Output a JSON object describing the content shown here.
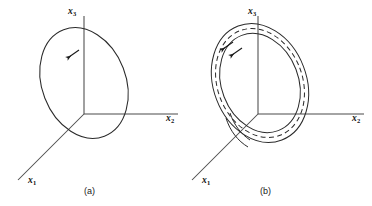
{
  "figure": {
    "background_color": "#ffffff",
    "stroke_color": "#1a1a1a",
    "panels": [
      {
        "id": "a",
        "caption": "(a)",
        "axes": [
          {
            "name": "x3",
            "label_base": "x",
            "label_sub": "3",
            "direction": "up"
          },
          {
            "name": "x2",
            "label_base": "x",
            "label_sub": "2",
            "direction": "right"
          },
          {
            "name": "x1",
            "label_base": "x",
            "label_sub": "1",
            "direction": "down-left"
          }
        ],
        "curves": [
          {
            "name": "closed-orbit",
            "style": "solid",
            "arrows": 1
          }
        ]
      },
      {
        "id": "b",
        "caption": "(b)",
        "axes": [
          {
            "name": "x3",
            "label_base": "x",
            "label_sub": "3",
            "direction": "up"
          },
          {
            "name": "x2",
            "label_base": "x",
            "label_sub": "2",
            "direction": "right"
          },
          {
            "name": "x1",
            "label_base": "x",
            "label_sub": "1",
            "direction": "down-left"
          }
        ],
        "curves": [
          {
            "name": "outer-spiral",
            "style": "solid",
            "arrows": 1
          },
          {
            "name": "limit-cycle",
            "style": "dashed",
            "arrows": 0
          },
          {
            "name": "inner-spiral",
            "style": "solid",
            "arrows": 1
          }
        ]
      }
    ]
  }
}
